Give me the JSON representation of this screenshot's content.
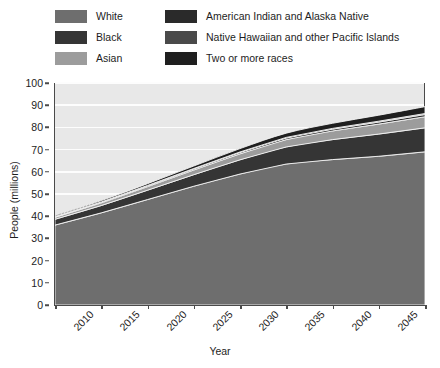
{
  "chart_data": {
    "type": "area",
    "title": "",
    "subtitle": "",
    "xlabel": "Year",
    "ylabel": "People (millions)",
    "xlim": [
      2010,
      2050
    ],
    "ylim": [
      0,
      100
    ],
    "grid": true,
    "stacked": true,
    "legend_position": "top",
    "x": [
      2010,
      2015,
      2020,
      2025,
      2030,
      2035,
      2040,
      2045,
      2050
    ],
    "xticklabels": [
      "2010",
      "2015",
      "2020",
      "2025",
      "2030",
      "2035",
      "2040",
      "2045",
      "2050"
    ],
    "yticks": [
      0,
      10,
      20,
      30,
      40,
      50,
      60,
      70,
      80,
      90,
      100
    ],
    "yticklabels": [
      "0",
      "10",
      "20",
      "30",
      "40",
      "50",
      "60",
      "70",
      "80",
      "90",
      "100"
    ],
    "series": [
      {
        "name": "White",
        "color": "#6e6e6e",
        "values": [
          36.0,
          41.5,
          47.5,
          53.5,
          59.0,
          63.5,
          65.5,
          67.0,
          69.0
        ]
      },
      {
        "name": "Black",
        "color": "#353535",
        "values": [
          2.6,
          3.3,
          4.2,
          5.2,
          6.4,
          7.7,
          9.0,
          10.0,
          10.8
        ]
      },
      {
        "name": "Asian",
        "color": "#9c9c9c",
        "values": [
          0.9,
          1.2,
          1.6,
          2.1,
          2.7,
          3.3,
          3.9,
          4.5,
          5.0
        ]
      },
      {
        "name": "American Indian and Alaska Native",
        "color": "#2a2a2a",
        "values": [
          0.25,
          0.3,
          0.4,
          0.5,
          0.6,
          0.7,
          0.8,
          0.9,
          1.0
        ]
      },
      {
        "name": "Native Hawaiian and other Pacific Islands",
        "color": "#4a4a4a",
        "values": [
          0.1,
          0.12,
          0.15,
          0.2,
          0.25,
          0.3,
          0.35,
          0.4,
          0.45
        ]
      },
      {
        "name": "Two or more races",
        "color": "#1f1f1f",
        "values": [
          0.45,
          0.6,
          0.8,
          1.1,
          1.5,
          1.9,
          2.3,
          2.7,
          3.1
        ]
      }
    ],
    "totals": [
      40.3,
      47.0,
      54.65,
      62.6,
      70.45,
      77.4,
      81.85,
      85.5,
      89.35
    ]
  },
  "legend": {
    "columns": [
      {
        "items": [
          {
            "label": "White",
            "color": "#6e6e6e"
          },
          {
            "label": "Black",
            "color": "#353535"
          },
          {
            "label": "Asian",
            "color": "#9c9c9c"
          }
        ]
      },
      {
        "items": [
          {
            "label": "American Indian and Alaska Native",
            "color": "#2a2a2a"
          },
          {
            "label": "Native Hawaiian and other Pacific Islands",
            "color": "#4a4a4a"
          },
          {
            "label": "Two or more races",
            "color": "#1f1f1f"
          }
        ]
      }
    ]
  },
  "colors": {
    "plot_background": "#e8e8e8",
    "gridline": "#fdfdfd",
    "axis": "#4a4a4a",
    "text": "#1d1d1d",
    "page_background": "#ffffff"
  }
}
